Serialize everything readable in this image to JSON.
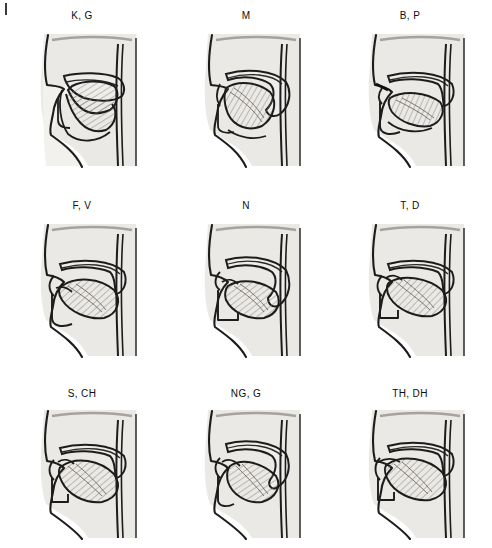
{
  "figure": {
    "columns": 3,
    "rows": 3,
    "background_color": "#ffffff",
    "ink_color": "#111111",
    "tissue_fill": "#e9e7e3",
    "tongue_fill": "#b6b2ad",
    "panels": [
      {
        "id": "panel-k-g",
        "label": "K, G",
        "row": 1,
        "col": 1
      },
      {
        "id": "panel-m",
        "label": "M",
        "row": 1,
        "col": 2
      },
      {
        "id": "panel-b-p",
        "label": "B, P",
        "row": 1,
        "col": 3
      },
      {
        "id": "panel-f-v",
        "label": "F, V",
        "row": 2,
        "col": 1
      },
      {
        "id": "panel-n",
        "label": "N",
        "row": 2,
        "col": 2
      },
      {
        "id": "panel-t-d",
        "label": "T, D",
        "row": 2,
        "col": 3
      },
      {
        "id": "panel-s-ch",
        "label": "S, CH",
        "row": 3,
        "col": 1
      },
      {
        "id": "panel-ng-g",
        "label": "NG, G",
        "row": 3,
        "col": 2
      },
      {
        "id": "panel-th-dh",
        "label": "TH, DH",
        "row": 3,
        "col": 3
      }
    ]
  }
}
